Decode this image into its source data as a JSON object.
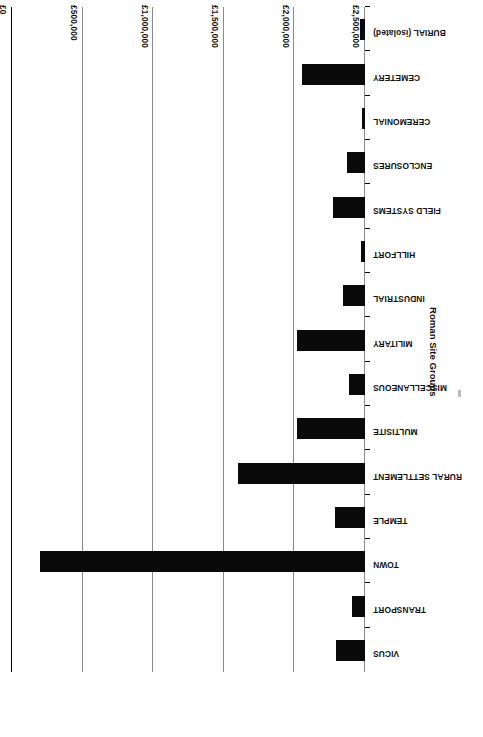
{
  "chart_data": {
    "type": "bar",
    "orientation": "horizontal",
    "title": "",
    "subtitle": "",
    "xlabel": "",
    "ylabel": "Roman Site Groups",
    "currency_symbol": "£",
    "grid": true,
    "legend": false,
    "legend_position": "none",
    "axis_inverted": true,
    "rotation_degrees": 180,
    "xlim": [
      0,
      2500000
    ],
    "tick_labels": [
      "£2,500,000",
      "£2,000,000",
      "£1,500,000",
      "£1,000,000",
      "£500,000",
      "£0"
    ],
    "tick_values": [
      2500000,
      2000000,
      1500000,
      1000000,
      500000,
      0
    ],
    "categories": [
      "VICUS",
      "TRANSPORT",
      "TOWN",
      "TEMPLE",
      "RURAL SETTLEMENT",
      "MULTISITE",
      "MISCELLANEOUS",
      "MILITARY",
      "INDUSTRIAL",
      "HILLFORT",
      "FIELD SYSTEMS",
      "ENCLOSURES",
      "CEREMONIAL",
      "CEMETERY",
      "BURIAL (isolated)"
    ],
    "values": [
      205000,
      92000,
      2300000,
      212000,
      900000,
      480000,
      113000,
      480000,
      156000,
      28000,
      227000,
      127000,
      21000,
      446000,
      35000
    ],
    "bar_color": "#0a0a0a",
    "gridline_color": "#8a8a8a",
    "axis_color": "#000000"
  }
}
